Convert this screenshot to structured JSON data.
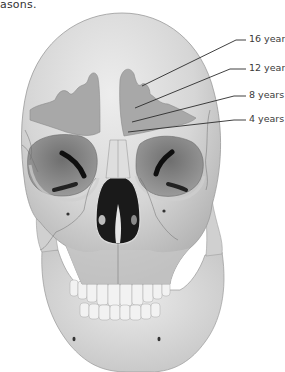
{
  "caption": {
    "fragment": "asons."
  },
  "diagram": {
    "labels": [
      {
        "id": "age-16",
        "text": "16 years"
      },
      {
        "id": "age-12",
        "text": "12 years"
      },
      {
        "id": "age-8",
        "text": "8 years"
      },
      {
        "id": "age-4",
        "text": "4 years"
      }
    ],
    "colors": {
      "bone": "#d9d9d9",
      "bone_light": "#ececec",
      "bone_shadow": "#b4b4b4",
      "sinus": "#9e9e9e",
      "orbit": "#7d7d7d",
      "cavity": "#1c1c1c",
      "leader_line": "#2b2b2b"
    }
  }
}
